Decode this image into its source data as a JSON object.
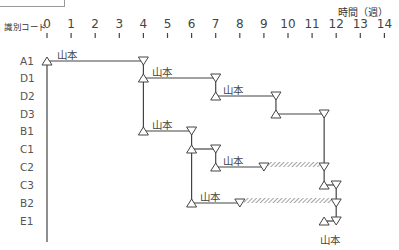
{
  "header": {
    "code_label": "識別コード",
    "axis_unit": "時間（週）"
  },
  "axis": {
    "ticks": [
      "0",
      "1",
      "2",
      "3",
      "4",
      "5",
      "6",
      "7",
      "8",
      "9",
      "10",
      "11",
      "12",
      "13",
      "14"
    ]
  },
  "rows": [
    "A1",
    "D1",
    "D2",
    "D3",
    "B1",
    "C1",
    "C2",
    "C3",
    "B2",
    "E1"
  ],
  "owners": {
    "a1": "山本",
    "d1": "山本",
    "d2": "山本",
    "b1": "山本",
    "c2": "山本",
    "b2": "山本",
    "e1": "山本"
  },
  "chart_data": {
    "type": "gantt",
    "title": "",
    "xlabel": "時間（週）",
    "ylabel": "識別コード",
    "xlim": [
      0,
      14
    ],
    "tasks": [
      {
        "id": "A1",
        "start": 0,
        "end": 4,
        "owner": "山本"
      },
      {
        "id": "D1",
        "start": 4,
        "end": 7,
        "owner": "山本"
      },
      {
        "id": "D2",
        "start": 7,
        "end": 9.5,
        "owner": "山本"
      },
      {
        "id": "D3",
        "start": 9.5,
        "end": 11.5,
        "owner": ""
      },
      {
        "id": "B1",
        "start": 4,
        "end": 6,
        "owner": "山本"
      },
      {
        "id": "C1",
        "start": 6,
        "end": 7,
        "owner": ""
      },
      {
        "id": "C2",
        "start": 7,
        "end": 9,
        "float_end": 11.5,
        "owner": "山本"
      },
      {
        "id": "C3",
        "start": 11.5,
        "end": 12,
        "owner": ""
      },
      {
        "id": "B2",
        "start": 6,
        "end": 8,
        "float_end": 12,
        "owner": "山本"
      },
      {
        "id": "E1",
        "start": 11.5,
        "end": 12,
        "owner": "山本"
      }
    ],
    "legend": {
      "start_marker": "△",
      "end_marker": "▽",
      "hatched": "float / slack"
    }
  }
}
